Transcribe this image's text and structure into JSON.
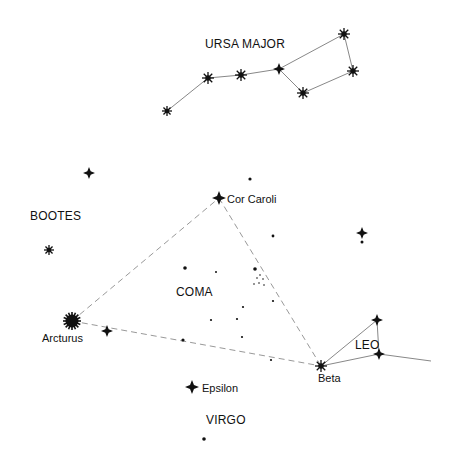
{
  "constellations": [
    {
      "id": "ursa-major",
      "label": "URSA MAJOR",
      "x": 205,
      "y": 48
    },
    {
      "id": "bootes",
      "label": "BOOTES",
      "x": 30,
      "y": 220
    },
    {
      "id": "coma",
      "label": "COMA",
      "x": 176,
      "y": 296
    },
    {
      "id": "leo",
      "label": "LEO",
      "x": 355,
      "y": 349
    },
    {
      "id": "virgo",
      "label": "VIRGO",
      "x": 206,
      "y": 424
    }
  ],
  "named_stars": [
    {
      "id": "cor-caroli",
      "label": "Cor Caroli",
      "x": 219,
      "y": 198,
      "lx": 227,
      "ly": 203,
      "type": "cross",
      "size": 7
    },
    {
      "id": "arcturus",
      "label": "Arcturus",
      "x": 72,
      "y": 321,
      "lx": 42,
      "ly": 342,
      "type": "burst-large",
      "size": 9
    },
    {
      "id": "beta",
      "label": "Beta",
      "x": 321,
      "y": 366,
      "lx": 318,
      "ly": 382,
      "type": "burst",
      "size": 6
    },
    {
      "id": "epsilon",
      "label": "Epsilon",
      "x": 192,
      "y": 387,
      "lx": 202,
      "ly": 392,
      "type": "cross",
      "size": 7
    }
  ],
  "stars": [
    {
      "x": 167,
      "y": 111,
      "type": "burst",
      "size": 5
    },
    {
      "x": 208,
      "y": 78,
      "type": "burst",
      "size": 6
    },
    {
      "x": 241,
      "y": 75,
      "type": "burst",
      "size": 6
    },
    {
      "x": 279,
      "y": 69,
      "type": "cross",
      "size": 6
    },
    {
      "x": 303,
      "y": 93,
      "type": "burst",
      "size": 6
    },
    {
      "x": 344,
      "y": 34,
      "type": "burst",
      "size": 6
    },
    {
      "x": 353,
      "y": 71,
      "type": "burst",
      "size": 6
    },
    {
      "x": 89,
      "y": 173,
      "type": "cross",
      "size": 6
    },
    {
      "x": 49,
      "y": 250,
      "type": "burst",
      "size": 5
    },
    {
      "x": 107,
      "y": 331,
      "type": "cross",
      "size": 6
    },
    {
      "x": 362,
      "y": 233,
      "type": "cross",
      "size": 6
    },
    {
      "x": 377,
      "y": 320,
      "type": "cross",
      "size": 6
    },
    {
      "x": 379,
      "y": 354,
      "type": "cross",
      "size": 6
    }
  ],
  "dots": [
    {
      "x": 250,
      "y": 179,
      "r": 1.6
    },
    {
      "x": 273,
      "y": 236,
      "r": 1.4
    },
    {
      "x": 362,
      "y": 242,
      "r": 1.5
    },
    {
      "x": 185,
      "y": 268,
      "r": 1.8
    },
    {
      "x": 216,
      "y": 272,
      "r": 1.0
    },
    {
      "x": 255,
      "y": 269,
      "r": 1.8
    },
    {
      "x": 257,
      "y": 278,
      "r": 0.8
    },
    {
      "x": 260,
      "y": 275,
      "r": 0.8
    },
    {
      "x": 263,
      "y": 279,
      "r": 0.8
    },
    {
      "x": 254,
      "y": 284,
      "r": 0.8
    },
    {
      "x": 259,
      "y": 283,
      "r": 0.8
    },
    {
      "x": 264,
      "y": 285,
      "r": 0.8
    },
    {
      "x": 273,
      "y": 301,
      "r": 1.1
    },
    {
      "x": 243,
      "y": 307,
      "r": 1.1
    },
    {
      "x": 211,
      "y": 320,
      "r": 1.1
    },
    {
      "x": 237,
      "y": 319,
      "r": 1.1
    },
    {
      "x": 242,
      "y": 337,
      "r": 1.1
    },
    {
      "x": 183,
      "y": 340,
      "r": 1.6
    },
    {
      "x": 271,
      "y": 360,
      "r": 1.1
    },
    {
      "x": 204,
      "y": 439,
      "r": 1.8
    }
  ],
  "solid_lines": [
    [
      [
        167,
        111
      ],
      [
        208,
        78
      ]
    ],
    [
      [
        208,
        78
      ],
      [
        241,
        75
      ]
    ],
    [
      [
        241,
        75
      ],
      [
        279,
        69
      ]
    ],
    [
      [
        279,
        69
      ],
      [
        344,
        34
      ]
    ],
    [
      [
        344,
        34
      ],
      [
        353,
        71
      ]
    ],
    [
      [
        353,
        71
      ],
      [
        303,
        93
      ]
    ],
    [
      [
        303,
        93
      ],
      [
        279,
        69
      ]
    ],
    [
      [
        321,
        366
      ],
      [
        377,
        320
      ]
    ],
    [
      [
        377,
        320
      ],
      [
        379,
        354
      ]
    ],
    [
      [
        321,
        366
      ],
      [
        379,
        354
      ]
    ],
    [
      [
        379,
        354
      ],
      [
        431,
        361
      ]
    ]
  ],
  "dashed_lines": [
    [
      [
        72,
        321
      ],
      [
        219,
        198
      ]
    ],
    [
      [
        219,
        198
      ],
      [
        321,
        366
      ]
    ],
    [
      [
        72,
        321
      ],
      [
        321,
        366
      ]
    ]
  ]
}
